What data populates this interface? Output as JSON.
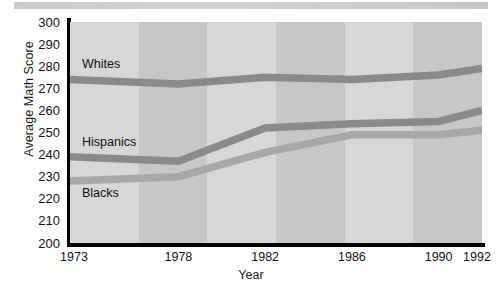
{
  "chart_data": {
    "type": "line",
    "title": "",
    "xlabel": "Year",
    "ylabel": "Average Math Score",
    "categories": [
      "1973",
      "1978",
      "1982",
      "1986",
      "1990",
      "1992"
    ],
    "x": [
      1973,
      1978,
      1982,
      1986,
      1990,
      1992
    ],
    "xlim": [
      1973,
      1992
    ],
    "ylim": [
      200,
      300
    ],
    "yticks": [
      "300",
      "290",
      "280",
      "270",
      "260",
      "250",
      "240",
      "230",
      "220",
      "210",
      "200"
    ],
    "ytick_values": [
      300,
      290,
      280,
      270,
      260,
      250,
      240,
      230,
      220,
      210,
      200
    ],
    "grid": false,
    "legend_position": "inline-labels",
    "series": [
      {
        "name": "Whites",
        "label": "Whites",
        "color": "#8a8a8a",
        "values": [
          274,
          272,
          275,
          274,
          276,
          279
        ]
      },
      {
        "name": "Hispanics",
        "label": "Hispanics",
        "color": "#8a8a8a",
        "values": [
          239,
          237,
          252,
          254,
          255,
          260
        ]
      },
      {
        "name": "Blacks",
        "label": "Blacks",
        "color": "#a8a8a8",
        "values": [
          228,
          230,
          241,
          249,
          249,
          251
        ]
      }
    ]
  },
  "colors": {
    "plot_background": "#d0d0d0",
    "band_light": "#d7d7d7",
    "band_dark": "#c7c7c7",
    "axis": "#000000",
    "text": "#141414",
    "series_dark": "#8a8a8a",
    "series_light": "#a8a8a8",
    "top_banner": "#cccccc"
  }
}
